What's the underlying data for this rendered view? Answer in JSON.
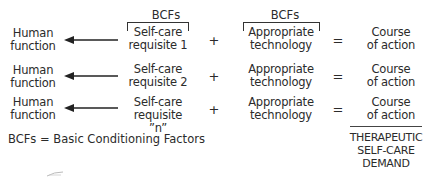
{
  "header": {
    "bcf_label_requisite": "BCFs",
    "bcf_label_technology": "BCFs"
  },
  "rows": [
    {
      "human_function": [
        "Human",
        "function"
      ],
      "requisite": [
        "Self-care",
        "requisite 1"
      ],
      "plus": "+",
      "technology": [
        "Appropriate",
        "technology"
      ],
      "equals": "=",
      "course": [
        "Course",
        "of action"
      ]
    },
    {
      "human_function": [
        "Human",
        "function"
      ],
      "requisite": [
        "Self-care",
        "requisite 2"
      ],
      "plus": "+",
      "technology": [
        "Appropriate",
        "technology"
      ],
      "equals": "=",
      "course": [
        "Course",
        "of action"
      ]
    },
    {
      "human_function": [
        "Human",
        "function"
      ],
      "requisite": [
        "Self-care",
        "requisite ”n”"
      ],
      "plus": "+",
      "technology": [
        "Appropriate",
        "technology"
      ],
      "equals": "=",
      "course": [
        "Course",
        "of action"
      ]
    }
  ],
  "legend": "BCFs = Basic Conditioning Factors",
  "result": [
    "THERAPEUTIC",
    "SELF-CARE",
    "DEMAND"
  ],
  "icons": {
    "arrow": "left-arrow-icon"
  },
  "colors": {
    "text": "#2b2b2b",
    "lines": "#333333",
    "background": "#ffffff"
  }
}
